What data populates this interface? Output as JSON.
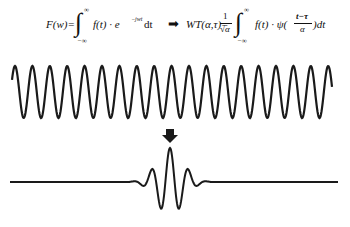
{
  "diagram": {
    "fourier_formula": {
      "lhs": "F(w)=",
      "integral": "∫",
      "upper_limit": "∞",
      "lower_limit": "−∞",
      "integrand": "f(t) · e",
      "exponent": "−jwt",
      "differential": "dt"
    },
    "implies_arrow": "➡",
    "wavelet_formula": {
      "lhs": "WT(α,τ)=",
      "coef_num": "1",
      "coef_den": "√α",
      "integral": "∫",
      "upper_limit": "∞",
      "lower_limit": "−∞",
      "integrand": "f(t) · ψ(",
      "arg_num": "t−τ",
      "arg_den": "α",
      "tail": ")dt"
    },
    "down_arrow": "⬇",
    "signals": [
      {
        "name": "sine-wave",
        "description": "continuous sinusoid",
        "cycles": 18.5
      },
      {
        "name": "wavelet",
        "description": "localized wavelet (Morlet-like)",
        "center_x": 170
      }
    ],
    "colors": {
      "stroke": "#1a1a1a",
      "background": "#ffffff"
    }
  }
}
